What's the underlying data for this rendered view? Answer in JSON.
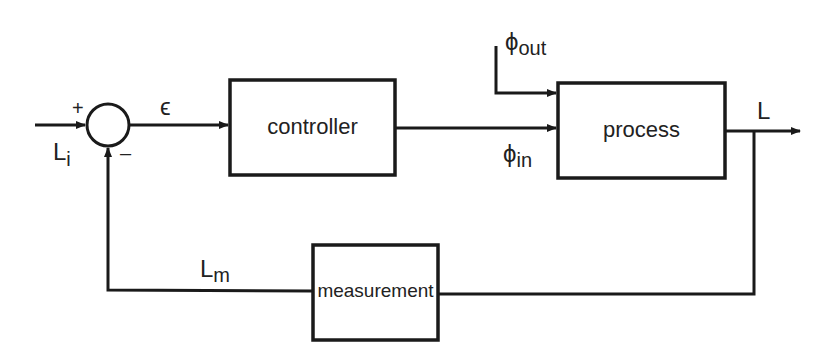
{
  "diagram": {
    "type": "feedback-control-loop",
    "blocks": {
      "controller": {
        "label": "controller"
      },
      "process": {
        "label": "process"
      },
      "measurement": {
        "label": "measurement"
      }
    },
    "summing_junction": {
      "plus_sign": "+",
      "minus_sign": "–"
    },
    "signals": {
      "input": {
        "symbol": "L",
        "subscript": "i"
      },
      "error": {
        "symbol": "ϵ"
      },
      "phi_in": {
        "symbol": "ϕ",
        "subscript": "in"
      },
      "phi_out": {
        "symbol": "ϕ",
        "subscript": "out"
      },
      "output": {
        "symbol": "L"
      },
      "measured": {
        "symbol": "L",
        "subscript": "m"
      }
    },
    "colors": {
      "line": "#1a1a1a",
      "background": "#ffffff"
    }
  }
}
